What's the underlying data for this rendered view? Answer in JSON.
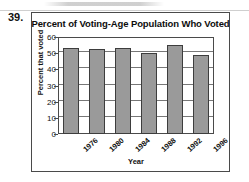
{
  "problem": {
    "number": "39."
  },
  "figure": {
    "border_color": "#4a4a4a",
    "background": "#ffffff"
  },
  "chart_data": {
    "type": "bar",
    "title": "Percent of Voting-Age Population Who Voted",
    "xlabel": "Year",
    "ylabel": "Percent that voted",
    "categories": [
      "1976",
      "1980",
      "1984",
      "1988",
      "1992",
      "1996"
    ],
    "values": [
      53.5,
      52.8,
      53.3,
      50.3,
      55.0,
      49.0
    ],
    "ylim": [
      0,
      60
    ],
    "yticks": [
      0,
      10,
      20,
      30,
      40,
      50,
      60
    ],
    "ytick_labels": [
      "0",
      "10",
      "20",
      "30",
      "40",
      "50",
      "60"
    ],
    "grid": true,
    "grid_axis": "y",
    "legend": false,
    "bar_fill_color": "#9a9a9a",
    "bar_edge_color": "#3d3d3d",
    "xtick_label_rotation": -42
  }
}
